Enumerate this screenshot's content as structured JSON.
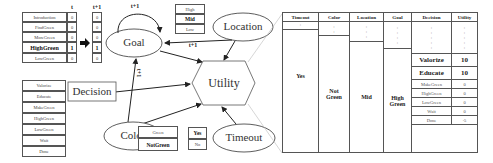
{
  "goal_table": {
    "col_t": "t",
    "col_t1": "t+1",
    "rows": [
      {
        "label": "Introduction",
        "t": "0",
        "t1": "0",
        "bold": false
      },
      {
        "label": "FindGreen",
        "t": "0",
        "t1": "0",
        "bold": false
      },
      {
        "label": "MoreGreen",
        "t": "0",
        "t1": "0",
        "bold": false
      },
      {
        "label": "HighGreen",
        "t": "1",
        "t1": "1",
        "bold": true
      },
      {
        "label": "LowGreen",
        "t": "0",
        "t1": "0",
        "bold": false
      }
    ]
  },
  "decision_list": [
    "Valorize",
    "Educate",
    "MakeGreen",
    "HighGreen",
    "LowGreen",
    "Wait",
    "Done"
  ],
  "location_list": [
    {
      "label": "High",
      "bold": false
    },
    {
      "label": "Mid",
      "bold": true
    },
    {
      "label": "Low",
      "bold": false
    }
  ],
  "color_list": [
    {
      "label": "Green",
      "bold": false
    },
    {
      "label": "NotGreen",
      "bold": true
    }
  ],
  "timeout_list": [
    {
      "label": "Yes",
      "bold": true
    },
    {
      "label": "No",
      "bold": false
    }
  ],
  "nodes": {
    "goal": "Goal",
    "location": "Location",
    "utility": "Utility",
    "decision": "Decision",
    "color": "Color",
    "timeout": "Timeout"
  },
  "edge_labels": {
    "goal_self": "t+1",
    "location_goal": "t+1",
    "color_goal": "t+1"
  },
  "utility_table": {
    "headers": [
      "Timeout",
      "Color",
      "Location",
      "Goal",
      "Decision",
      "Utility"
    ],
    "timeout_value": "Yes",
    "color_value": "Not Green",
    "location_value": "Mid",
    "goal_value": "High Green",
    "rows": [
      {
        "decision": "Valorize",
        "utility": "10",
        "bold": true
      },
      {
        "decision": "Educate",
        "utility": "10",
        "bold": true
      },
      {
        "decision": "MakeGreen",
        "utility": "0",
        "bold": false
      },
      {
        "decision": "HighGreen",
        "utility": "0",
        "bold": false
      },
      {
        "decision": "LowGreen",
        "utility": "0",
        "bold": false
      },
      {
        "decision": "Wait",
        "utility": "0",
        "bold": false
      },
      {
        "decision": "Done",
        "utility": "-5",
        "bold": false
      }
    ],
    "ellipsis": ":"
  }
}
